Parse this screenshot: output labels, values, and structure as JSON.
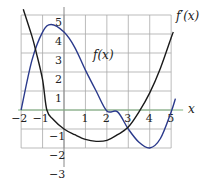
{
  "chart_data": {
    "type": "line",
    "title": "",
    "xlabel": "x",
    "ylabel": "",
    "xlim": [
      -2,
      5
    ],
    "ylim": [
      -3,
      5
    ],
    "grid": true,
    "x_ticks": [
      "−2",
      "−1",
      "1",
      "2",
      "3",
      "4",
      "5"
    ],
    "y_ticks": [
      "5",
      "4",
      "3",
      "2",
      "1",
      "−1",
      "−2",
      "−3"
    ],
    "series": [
      {
        "name": "f(x)",
        "color": "#2b3a8c",
        "x": [
          -2,
          -1.5,
          -1,
          -0.6,
          0,
          0.5,
          1,
          1.5,
          2,
          2.5,
          3,
          3.5,
          4,
          4.5,
          5,
          5.2
        ],
        "y": [
          0,
          2.6,
          4.1,
          4.5,
          4.1,
          3.3,
          2.1,
          1.0,
          -0.05,
          -0.1,
          -1.0,
          -1.7,
          -2.0,
          -1.5,
          -0.1,
          0.6
        ]
      },
      {
        "name": "f'(x)",
        "color": "#1a1a1a",
        "x": [
          -1.9,
          -1.5,
          -1.3,
          -1,
          -0.8,
          -0.5,
          0,
          0.5,
          1,
          1.5,
          2,
          2.5,
          3,
          3.5,
          4,
          4.5,
          5,
          5.1
        ],
        "y": [
          5.3,
          3.9,
          3.05,
          1.6,
          0.0,
          -0.5,
          -1.0,
          -1.3,
          -1.55,
          -1.65,
          -1.6,
          -1.3,
          -0.9,
          -0.1,
          0.9,
          2.2,
          3.8,
          4.1
        ]
      }
    ],
    "annotations": [
      {
        "text": "f(x)",
        "x": 1.4,
        "y": 3
      },
      {
        "text": "f'(x)",
        "x": 5.6,
        "y": 4.9
      }
    ]
  },
  "labels": {
    "f": "f(x)",
    "fprime": "f′(x)",
    "xaxis": "x"
  }
}
